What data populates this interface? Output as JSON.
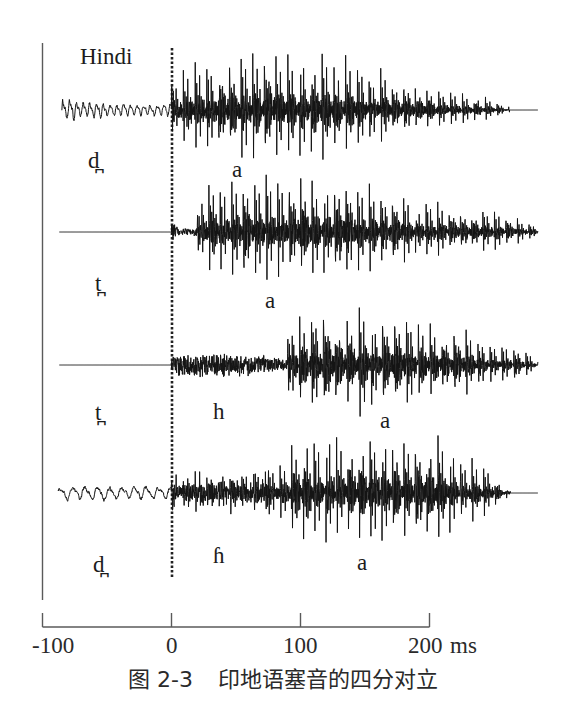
{
  "figure": {
    "caption_label": "图 2-3",
    "caption_text": "印地语塞音的四分对立"
  },
  "chart_data": {
    "type": "line",
    "subtype": "waveform",
    "title": "Hindi",
    "caption": "图 2-3 印地语塞音的四分对立",
    "xlabel": "ms",
    "ylabel": "",
    "xlim": [
      -100,
      200
    ],
    "x_ticks": [
      -100,
      0,
      100,
      200
    ],
    "x_tick_labels": [
      "-100",
      "0",
      "100",
      "200"
    ],
    "ylim": [
      -1.1,
      1.1
    ],
    "amplitude_units": "normalized",
    "grid": false,
    "legend": null,
    "reference_line": {
      "x": 0,
      "style": "dotted"
    },
    "style": {
      "waveform_color": "#141414",
      "axis_color": "#5a5a5a",
      "reference_line_color": "#222222"
    },
    "series": [
      {
        "name": "d̪ a",
        "labels": [
          "d̪",
          "a"
        ],
        "label_positions_ms": [
          -60,
          53
        ],
        "segments": [
          {
            "type": "prevoicing",
            "start": -85,
            "end": 0,
            "period_ms": 5.2,
            "envelope": [
              [
                -85,
                0.16
              ],
              [
                -65,
                0.12
              ],
              [
                -30,
                0.08
              ],
              [
                0,
                0.09
              ]
            ]
          },
          {
            "type": "voiced",
            "start": 0,
            "end": 262,
            "period_ms": 9.0,
            "envelope": [
              [
                0,
                0.5
              ],
              [
                15,
                0.75
              ],
              [
                45,
                1.0
              ],
              [
                100,
                1.0
              ],
              [
                125,
                0.92
              ],
              [
                155,
                0.7
              ],
              [
                185,
                0.5
              ],
              [
                215,
                0.34
              ],
              [
                245,
                0.2
              ],
              [
                262,
                0.05
              ]
            ]
          },
          {
            "type": "silence",
            "start": 262,
            "end": 284
          }
        ]
      },
      {
        "name": "t̪ a",
        "labels": [
          "t̪",
          "a"
        ],
        "label_positions_ms": [
          -56,
          77
        ],
        "segments": [
          {
            "type": "silence",
            "start": -87,
            "end": 0
          },
          {
            "type": "burst",
            "start": 0,
            "end": 20,
            "envelope": [
              [
                0,
                0.25
              ],
              [
                2,
                0.18
              ],
              [
                6,
                0.08
              ],
              [
                16,
                0.08
              ],
              [
                20,
                0.12
              ]
            ]
          },
          {
            "type": "voiced",
            "start": 20,
            "end": 284,
            "period_ms": 8.8,
            "envelope": [
              [
                20,
                0.35
              ],
              [
                26,
                0.85
              ],
              [
                40,
                0.92
              ],
              [
                80,
                1.0
              ],
              [
                130,
                0.98
              ],
              [
                160,
                0.85
              ],
              [
                190,
                0.55
              ],
              [
                230,
                0.44
              ],
              [
                260,
                0.34
              ],
              [
                284,
                0.1
              ]
            ]
          }
        ]
      },
      {
        "name": "t̪ h a",
        "labels": [
          "t̪",
          "h",
          "a"
        ],
        "label_positions_ms": [
          -56,
          37,
          167
        ],
        "segments": [
          {
            "type": "silence",
            "start": -87,
            "end": 0
          },
          {
            "type": "aspiration",
            "start": 0,
            "end": 90,
            "envelope": [
              [
                0,
                0.15
              ],
              [
                4,
                0.26
              ],
              [
                45,
                0.25
              ],
              [
                75,
                0.2
              ],
              [
                90,
                0.1
              ]
            ]
          },
          {
            "type": "voiced",
            "start": 90,
            "end": 284,
            "period_ms": 9.2,
            "envelope": [
              [
                90,
                0.55
              ],
              [
                96,
                0.95
              ],
              [
                110,
                1.0
              ],
              [
                170,
                1.0
              ],
              [
                190,
                0.78
              ],
              [
                215,
                0.66
              ],
              [
                240,
                0.5
              ],
              [
                270,
                0.36
              ],
              [
                284,
                0.1
              ]
            ]
          }
        ]
      },
      {
        "name": "d̪ ɦ a",
        "labels": [
          "d̪",
          "ɦ",
          "a"
        ],
        "label_positions_ms": [
          -56,
          37,
          150
        ],
        "segments": [
          {
            "type": "prevoicing",
            "start": -88,
            "end": 0,
            "period_ms": 9.5,
            "envelope": [
              [
                -88,
                0.1
              ],
              [
                0,
                0.1
              ]
            ]
          },
          {
            "type": "breathy",
            "start": 0,
            "end": 75,
            "period_ms": 9.0,
            "envelope": [
              [
                0,
                0.3
              ],
              [
                20,
                0.32
              ],
              [
                55,
                0.3
              ],
              [
                75,
                0.4
              ]
            ]
          },
          {
            "type": "voiced",
            "start": 75,
            "end": 263,
            "period_ms": 8.8,
            "envelope": [
              [
                75,
                0.45
              ],
              [
                85,
                0.55
              ],
              [
                92,
                0.72
              ],
              [
                100,
                0.92
              ],
              [
                115,
                1.0
              ],
              [
                130,
                1.05
              ],
              [
                200,
                1.05
              ],
              [
                210,
                0.9
              ],
              [
                224,
                0.7
              ],
              [
                240,
                0.5
              ],
              [
                251,
                0.32
              ],
              [
                259,
                0.12
              ],
              [
                263,
                0.03
              ]
            ]
          },
          {
            "type": "silence",
            "start": 263,
            "end": 284
          }
        ]
      }
    ]
  }
}
